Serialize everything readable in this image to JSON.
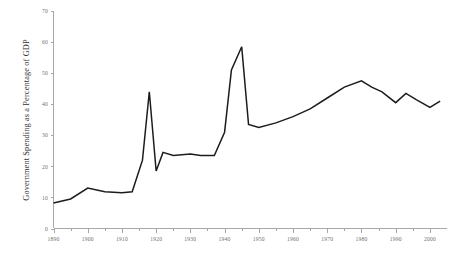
{
  "chart_data": {
    "type": "line",
    "title": "",
    "subtitle": "",
    "xlabel": "",
    "ylabel": "Government Spending as a Percentage of GDP",
    "xlim": [
      1890,
      2005
    ],
    "ylim": [
      0,
      70
    ],
    "grid": false,
    "legend": false,
    "legend_position": "none",
    "line_color": "#1c1c1c",
    "axis_color": "#a8a8a8",
    "xticks": [
      1890,
      1900,
      1910,
      1920,
      1930,
      1940,
      1950,
      1960,
      1970,
      1980,
      1990,
      2000
    ],
    "xtick_labels": [
      "1890",
      "1900",
      "1910",
      "1920",
      "1930",
      "1940",
      "1950",
      "1960",
      "1970",
      "1980",
      "1990",
      "2000"
    ],
    "xminor_ticks": [
      1895,
      1905,
      1915,
      1925,
      1935,
      1945,
      1955,
      1965,
      1975,
      1985,
      1995
    ],
    "yticks": [
      0,
      10,
      20,
      30,
      40,
      50,
      60,
      70
    ],
    "ytick_labels": [
      "0",
      "10",
      "20",
      "30",
      "40",
      "50",
      "60",
      "70"
    ],
    "series": [
      {
        "name": "Government Spending as a Percentage of GDP",
        "x": [
          1890,
          1895,
          1900,
          1905,
          1910,
          1913,
          1916,
          1918,
          1920,
          1922,
          1925,
          1930,
          1933,
          1935,
          1937,
          1940,
          1942,
          1944,
          1945,
          1947,
          1950,
          1955,
          1960,
          1965,
          1970,
          1975,
          1980,
          1983,
          1986,
          1990,
          1993,
          1996,
          2000,
          2003
        ],
        "values": [
          8.2,
          9.5,
          13.0,
          11.8,
          11.5,
          11.8,
          22.0,
          44.0,
          18.5,
          24.5,
          23.5,
          24.0,
          23.5,
          23.5,
          23.5,
          31.0,
          51.0,
          56.0,
          58.5,
          33.5,
          32.5,
          34.0,
          36.0,
          38.5,
          42.0,
          45.5,
          47.5,
          45.5,
          44.0,
          40.5,
          43.5,
          41.5,
          39.0,
          41.0
        ]
      }
    ]
  }
}
